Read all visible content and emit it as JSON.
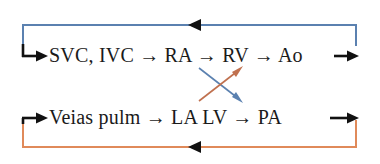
{
  "diagram": {
    "type": "flow-diagram",
    "background_color": "#ffffff",
    "rows": [
      {
        "id": "systemic",
        "label": "SVC, IVC → RA → RV → Ao",
        "nodes": [
          "SVC, IVC",
          "RA",
          "RV",
          "Ao"
        ],
        "loop_color": "#5b81b0",
        "loop_name": "systemic-return-loop"
      },
      {
        "id": "pulmonary",
        "label": "Veias pulm → LA LV → PA",
        "nodes": [
          "Veias pulm",
          "LA",
          "LV",
          "PA"
        ],
        "loop_color": "#e08a5a",
        "loop_name": "pulmonary-return-loop"
      }
    ],
    "cross_arrows": [
      {
        "id": "ra-to-lv",
        "from": "RA",
        "to": "LV",
        "color": "#5b81b0",
        "direction": "down-right"
      },
      {
        "id": "la-to-rv",
        "from": "LA",
        "to": "RV",
        "color": "#c0714f",
        "direction": "up-right"
      }
    ],
    "connector_color": "#111111",
    "arrow_glyph": "→"
  }
}
